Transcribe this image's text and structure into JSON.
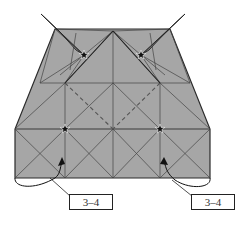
{
  "diagram": {
    "type": "origami-fold-diagram",
    "colors": {
      "paper": "#a6a6a6",
      "paper_dark": "#9a9a9a",
      "line": "#3a3a3a",
      "mountain_line": "#5a5a5a",
      "star": "#111111"
    },
    "stars": [
      {
        "id": "upper-left",
        "x": 84,
        "y": 55
      },
      {
        "id": "upper-right",
        "x": 141,
        "y": 55
      },
      {
        "id": "lower-left",
        "x": 65,
        "y": 129
      },
      {
        "id": "lower-right",
        "x": 160,
        "y": 129
      }
    ],
    "labels": [
      {
        "id": "left",
        "text": "3–4"
      },
      {
        "id": "right",
        "text": "3–4"
      }
    ]
  }
}
